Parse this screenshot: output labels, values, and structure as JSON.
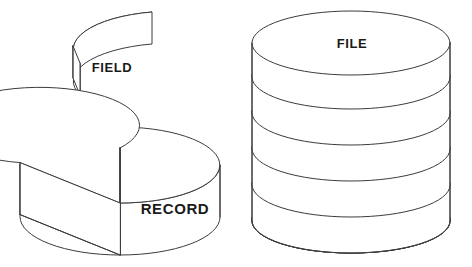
{
  "diagram": {
    "background_color": "#ffffff",
    "line_color": "#3c3c3c",
    "fill_color": "#ffffff",
    "text_color": "#1a1a1a",
    "shapes": [
      {
        "id": "field",
        "label": "FIELD",
        "type": "wedge-slice",
        "description": "A single pie-wedge slice of a disc, drawn detached above the record disc",
        "label_position": {
          "x": 112,
          "y": 72
        }
      },
      {
        "id": "record",
        "label": "RECORD",
        "type": "disc-with-wedge-removed",
        "description": "A short cylinder (disc) with one pie wedge cut out of its top-left, exposing the inner radial walls",
        "label_position": {
          "x": 175,
          "y": 214
        }
      },
      {
        "id": "file",
        "label": "FILE",
        "type": "stacked-discs",
        "layer_count": 5,
        "description": "Five identical discs stacked vertically to form a cylinder",
        "label_position": {
          "x": 352,
          "y": 48
        }
      }
    ]
  },
  "geometry": {
    "field": {
      "apex": {
        "x": 73,
        "y": 46
      },
      "top_outer_right": {
        "x": 152,
        "y": 12
      },
      "thickness": 32
    },
    "record": {
      "center": {
        "x": 120,
        "y": 165
      },
      "radius_x": 100,
      "radius_y": 38,
      "thickness": 52,
      "wedge_start_deg": 182,
      "wedge_end_deg": 238
    },
    "file": {
      "center_x": 351,
      "radius_x": 99,
      "radius_y": 32,
      "top_y": 43,
      "layer_height": 36,
      "layers": 5
    }
  }
}
